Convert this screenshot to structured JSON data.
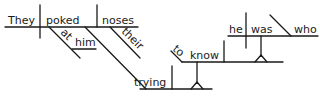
{
  "diagram": {
    "type": "sentence-diagram",
    "sentence": "They poked at him, their noses trying to know who he was.",
    "words": {
      "subject": "They",
      "verb": "poked",
      "object": "noses",
      "prep": "at",
      "prep_object": "him",
      "possessive": "their",
      "participle": "trying",
      "infinitive_to": "to",
      "infinitive_verb": "know",
      "clause_subject": "he",
      "clause_verb": "was",
      "clause_complement": "who"
    },
    "colors": {
      "ink": "#1a1a1a",
      "background": "#ffffff"
    }
  }
}
